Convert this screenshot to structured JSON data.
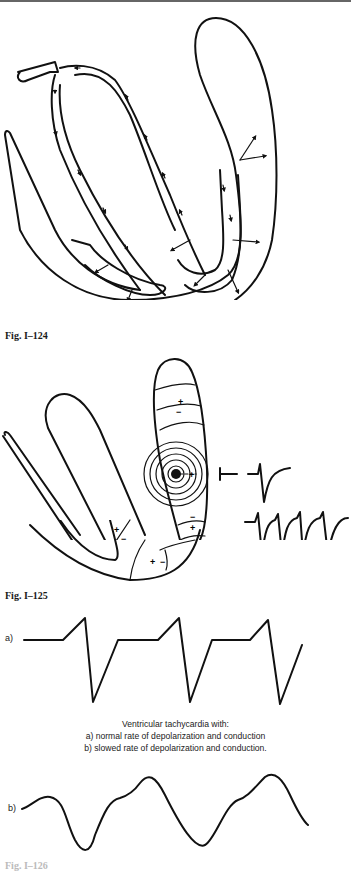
{
  "figures": [
    {
      "id": "fig1",
      "label": "Fig. I–124",
      "description": "Heart outline with conduction pathway arrows"
    },
    {
      "id": "fig2",
      "label": "Fig. I–125",
      "description": "Ventricle with ectopic focus, concentric depolarization waves, polarity markers and ECG complexes",
      "polarity_marks": [
        "+",
        "−",
        "+",
        "−",
        "−",
        "+",
        "+",
        "−",
        "+",
        "−"
      ]
    },
    {
      "id": "fig3",
      "label": "Fig. I–126",
      "trace_a_label": "a)",
      "trace_b_label": "b)",
      "caption": {
        "line1": "Ventricular tachycardia with:",
        "line2": "a) normal rate of depolarization and conduction",
        "line3": "b) slowed rate of depolarization and conduction."
      }
    }
  ],
  "colors": {
    "ink": "#111111",
    "background": "#ffffff"
  }
}
